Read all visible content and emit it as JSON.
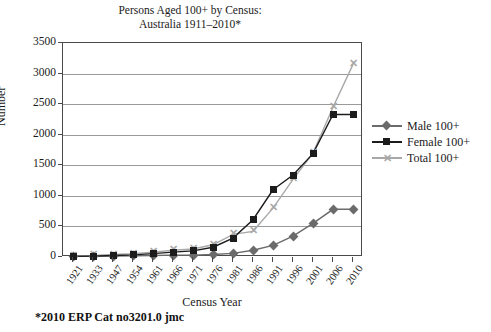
{
  "title": {
    "line1": "Persons Aged 100+ by Census:",
    "line2": "Australia 1911–2010*"
  },
  "footnote": "*2010 ERP  Cat no3201.0 jmc",
  "axis": {
    "x_title": "Census Year",
    "y_title": "Number"
  },
  "legend": {
    "position": "right",
    "items": [
      {
        "label": "Male 100+",
        "marker": "diamond",
        "color": "#6b6b6b"
      },
      {
        "label": "Female 100+",
        "marker": "square",
        "color": "#1c1c1c"
      },
      {
        "label": "Total 100+",
        "marker": "cross",
        "color": "#a8a8a8"
      }
    ]
  },
  "colors": {
    "male": "#6b6b6b",
    "female": "#1c1c1c",
    "total": "#a8a8a8",
    "grid": "#9a9a9a",
    "frame": "#4a4a4a",
    "text": "#1a1a1a",
    "background": "#ffffff"
  },
  "chart_data": {
    "type": "line",
    "title": "Persons Aged 100+ by Census: Australia 1911–2010*",
    "xlabel": "Census Year",
    "ylabel": "Number",
    "categories": [
      "1921",
      "1933",
      "1947",
      "1954",
      "1961",
      "1966",
      "1971",
      "1976",
      "1981",
      "1986",
      "1991",
      "1996",
      "2001",
      "2006",
      "2010"
    ],
    "ylim": [
      0,
      3500
    ],
    "yticks": [
      0,
      500,
      1000,
      1500,
      2000,
      2500,
      3000,
      3500
    ],
    "grid": true,
    "series": [
      {
        "name": "Male 100+",
        "marker": "diamond",
        "color": "#6b6b6b",
        "values": [
          10,
          10,
          15,
          20,
          25,
          30,
          30,
          40,
          60,
          110,
          190,
          340,
          550,
          780,
          780
        ]
      },
      {
        "name": "Female 100+",
        "marker": "square",
        "color": "#1c1c1c",
        "values": [
          10,
          15,
          25,
          35,
          55,
          80,
          100,
          160,
          310,
          610,
          1100,
          1340,
          1690,
          2330,
          2330
        ]
      },
      {
        "name": "Total 100+",
        "marker": "cross",
        "color": "#a8a8a8",
        "values": [
          20,
          25,
          40,
          55,
          80,
          110,
          130,
          200,
          370,
          420,
          800,
          1270,
          1700,
          2450,
          3150
        ]
      }
    ],
    "annotations": [
      "*2010 ERP  Cat no3201.0 jmc"
    ]
  }
}
